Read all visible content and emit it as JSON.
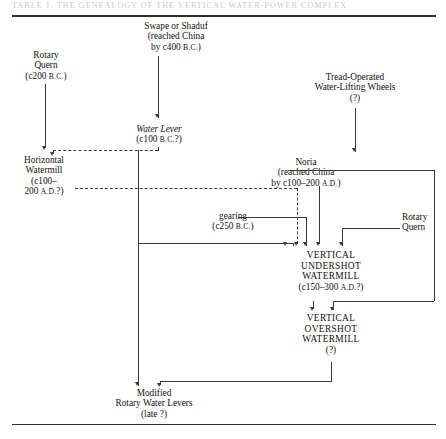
{
  "figure": {
    "title_ghost": "TABLE 1. THE GENEALOGY OF THE VERTICAL WATER-POWER COMPLEX",
    "domain": "historical-technology-flowchart"
  },
  "nodes": {
    "swape": {
      "name": "Swape or Shaduf",
      "line2": "(reached China",
      "line3_prefix": "by c400 ",
      "line3_era": "B.C.",
      "line3_suffix": ")"
    },
    "rotary_quern_top": {
      "line1": "Rotary",
      "line2": "Quern",
      "date_prefix": "(c200 ",
      "date_era": "B.C.",
      "date_suffix": ")"
    },
    "tread_wheels": {
      "line1": "Tread-Operated",
      "line2": "Water-Lifting  Wheels",
      "line3": "(?)"
    },
    "water_lever": {
      "name": "Water Lever",
      "date_prefix": "(c100  ",
      "date_era": "B.C.",
      "date_suffix": "?)"
    },
    "horizontal_watermill": {
      "line1": "Horizontal",
      "line2": "Watermill",
      "line3": "(c100–",
      "line4_prefix": "200  ",
      "line4_era": "A.D.",
      "line4_suffix": "?)"
    },
    "noria": {
      "name": "Noria",
      "line2": "(reached China",
      "line3_prefix": "by c100–200 ",
      "line3_era": "A.D.",
      "line3_suffix": ")"
    },
    "gearing": {
      "name": "gearing",
      "date_prefix": "(c250 ",
      "date_era": "B.C.",
      "date_suffix": ")"
    },
    "rotary_quern_right": {
      "line1": "Rotary",
      "line2": "Quern"
    },
    "vertical_undershot": {
      "line1": "VERTICAL",
      "line2": "UNDERSHOT",
      "line3": "WATERMILL",
      "date_prefix": "(c150–300 ",
      "date_era": "A.D.",
      "date_suffix": "?)"
    },
    "vertical_overshot": {
      "line1": "VERTICAL",
      "line2": "OVERSHOT",
      "line3": "WATERMILL",
      "line4": "(?)"
    },
    "modified_levers": {
      "line1": "Modified",
      "line2": "Rotary Water Levers",
      "line3": "(late  ?)"
    }
  },
  "colors": {
    "ink": "#111111",
    "connector": "#3a3a3a",
    "rule": "#2b2b2b",
    "page": "#ffffff"
  }
}
